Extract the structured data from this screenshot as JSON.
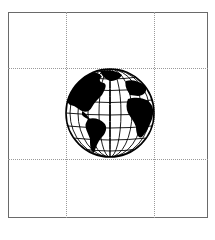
{
  "image": {
    "subject": "globe-icon",
    "description": "Black and white globe showing the Americas, Atlantic Ocean, Europe and Africa with latitude/longitude grid",
    "colors": {
      "ink": "#000000",
      "background": "#ffffff",
      "frame": "#6a6a6a",
      "grid": "#9a9a9a"
    },
    "grid": {
      "rows": 3,
      "cols": 3,
      "style": "dotted"
    }
  }
}
